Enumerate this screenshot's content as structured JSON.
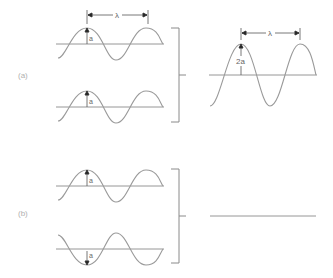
{
  "diagram": {
    "type": "wave-superposition",
    "colors": {
      "wave": "#9a9a9a",
      "axis": "#8a8a8a",
      "arrow": "#222222",
      "label": "#666666",
      "part_label": "#b0b0b0"
    },
    "parts": [
      {
        "id": "a",
        "label": "(a)",
        "description": "constructive interference",
        "inputs": [
          {
            "amplitude_label": "a",
            "phase": "in-phase",
            "wavelength_label": "λ"
          },
          {
            "amplitude_label": "a",
            "phase": "in-phase"
          }
        ],
        "result": {
          "amplitude_label": "2a",
          "wavelength_label": "λ"
        }
      },
      {
        "id": "b",
        "label": "(b)",
        "description": "destructive interference",
        "inputs": [
          {
            "amplitude_label": "a",
            "phase": "0"
          },
          {
            "amplitude_label": "a",
            "phase": "180° (inverted)"
          }
        ],
        "result": {
          "amplitude_label": "",
          "shape": "flat line"
        }
      }
    ],
    "labels": {
      "lambda": "λ",
      "amp_a": "a",
      "amp_2a": "2a",
      "part_a": "(a)",
      "part_b": "(b)"
    }
  }
}
